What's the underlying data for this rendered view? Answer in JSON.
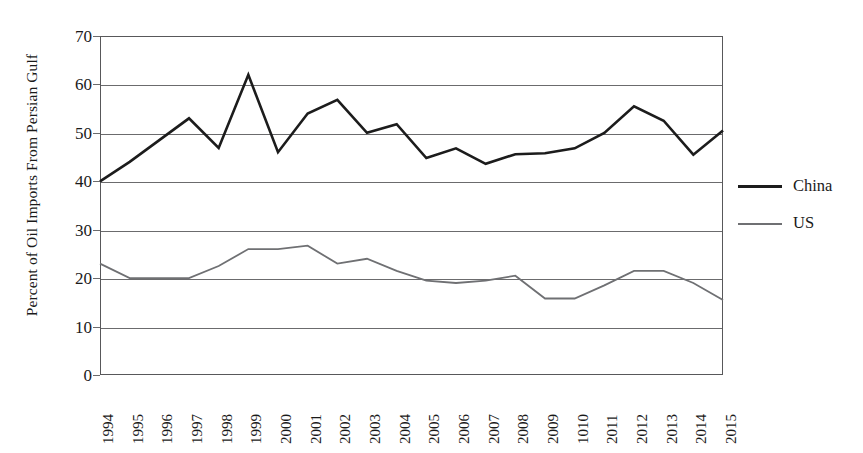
{
  "chart_data": {
    "type": "line",
    "title": "",
    "xlabel": "",
    "ylabel": "Percent of Oil Imports From Persian Gulf",
    "ylim": [
      0,
      70
    ],
    "ytick_step": 10,
    "yticks": [
      0,
      10,
      20,
      30,
      40,
      50,
      60,
      70
    ],
    "grid": true,
    "legend_position": "right",
    "categories": [
      "1994",
      "1995",
      "1996",
      "1997",
      "1998",
      "1999",
      "2000",
      "2001",
      "2002",
      "2003",
      "2004",
      "2005",
      "2006",
      "2007",
      "2008",
      "2009",
      "1010",
      "2011",
      "2012",
      "2013",
      "2014",
      "2015"
    ],
    "series": [
      {
        "name": "China",
        "color": "#1c1c1c",
        "width": 2.6,
        "values": [
          40.0,
          44.0,
          48.5,
          53.0,
          46.9,
          62.0,
          46.0,
          54.0,
          56.8,
          50.0,
          51.8,
          44.8,
          46.8,
          43.6,
          45.6,
          45.8,
          46.8,
          50.0,
          55.5,
          52.5,
          45.5,
          50.5
        ]
      },
      {
        "name": "US",
        "color": "#6f7073",
        "width": 1.8,
        "values": [
          23.0,
          20.0,
          20.0,
          20.0,
          22.5,
          26.0,
          26.0,
          26.7,
          23.0,
          24.0,
          21.5,
          19.5,
          19.0,
          19.5,
          20.5,
          15.8,
          15.8,
          18.5,
          21.5,
          21.5,
          19.0,
          15.5
        ]
      }
    ]
  },
  "legend": {
    "entries": [
      {
        "label": "China"
      },
      {
        "label": "US"
      }
    ]
  }
}
